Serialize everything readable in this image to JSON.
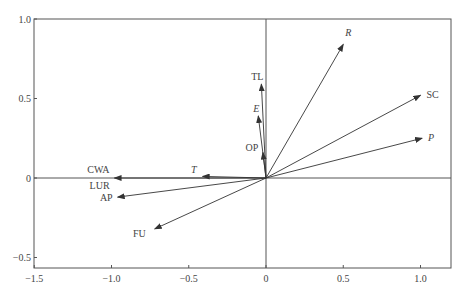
{
  "chart_data": {
    "type": "biplot",
    "title": "",
    "xlabel": "",
    "ylabel": "",
    "xlim": [
      -1.5,
      1.2
    ],
    "ylim": [
      -0.6,
      1.0
    ],
    "grid": false,
    "reference_lines": {
      "x0": true,
      "y0": true
    },
    "x_ticks": [
      {
        "value": -1.5,
        "label": "−1.5"
      },
      {
        "value": -1.0,
        "label": "−1.0"
      },
      {
        "value": -0.5,
        "label": "−0.5"
      },
      {
        "value": 0,
        "label": "0"
      },
      {
        "value": 0.5,
        "label": "0.5"
      },
      {
        "value": 1.0,
        "label": "1.0"
      }
    ],
    "y_ticks": [
      {
        "value": 1.0,
        "label": "1.0"
      },
      {
        "value": 0.5,
        "label": "0.5"
      },
      {
        "value": 0,
        "label": "0"
      },
      {
        "value": -0.5,
        "label": "−0.5"
      }
    ],
    "vectors": [
      {
        "name": "R",
        "italic": true,
        "x": 0.5,
        "y": 0.84,
        "label_dx": 2,
        "label_dy": -8,
        "anchor": "start"
      },
      {
        "name": "SC",
        "italic": false,
        "x": 1.0,
        "y": 0.52,
        "label_dx": 6,
        "label_dy": 3,
        "anchor": "start"
      },
      {
        "name": "P",
        "italic": true,
        "x": 1.01,
        "y": 0.25,
        "label_dx": 6,
        "label_dy": 3,
        "anchor": "start"
      },
      {
        "name": "TL",
        "italic": false,
        "x": -0.03,
        "y": 0.59,
        "label_dx": -4,
        "label_dy": -4,
        "anchor": "middle"
      },
      {
        "name": "E",
        "italic": true,
        "x": -0.05,
        "y": 0.39,
        "label_dx": -2,
        "label_dy": -4,
        "anchor": "middle"
      },
      {
        "name": "OP",
        "italic": false,
        "x": -0.02,
        "y": 0.16,
        "label_dx": -11,
        "label_dy": -2,
        "anchor": "middle"
      },
      {
        "name": "T",
        "italic": true,
        "x": -0.41,
        "y": 0.01,
        "label_dx": -6,
        "label_dy": -3,
        "anchor": "end"
      },
      {
        "name": "CWA",
        "italic": false,
        "x": -0.98,
        "y": 0.0,
        "label_dx": -5,
        "label_dy": -5,
        "anchor": "end"
      },
      {
        "name": "LUR",
        "italic": false,
        "x": -0.98,
        "y": 0.0,
        "label_dx": -5,
        "label_dy": 11,
        "anchor": "end"
      },
      {
        "name": "AP",
        "italic": false,
        "x": -0.96,
        "y": -0.12,
        "label_dx": -5,
        "label_dy": 4,
        "anchor": "end"
      },
      {
        "name": "FU",
        "italic": false,
        "x": -0.72,
        "y": -0.32,
        "label_dx": -9,
        "label_dy": 8,
        "anchor": "end"
      }
    ],
    "style": {
      "axis_color": "#555555",
      "vector_color": "#333333",
      "text_color": "#444444"
    }
  }
}
